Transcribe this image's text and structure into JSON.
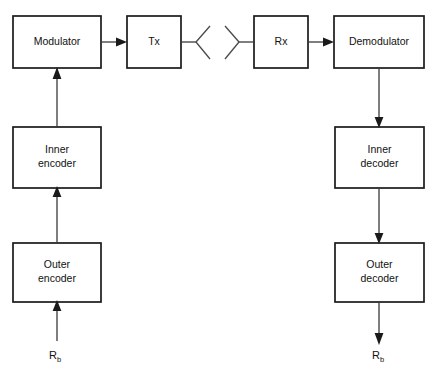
{
  "diagram": {
    "colors": {
      "box_stroke": "#1a1a1a",
      "connector": "#3a3a3a",
      "antenna": "#4a4a4a",
      "background": "#ffffff",
      "text": "#111111"
    },
    "blocks": [
      {
        "id": "modulator",
        "label": "Modulator",
        "x": 13,
        "y": 16,
        "w": 88,
        "h": 52
      },
      {
        "id": "tx",
        "label": "Tx",
        "x": 127,
        "y": 16,
        "w": 54,
        "h": 52
      },
      {
        "id": "rx",
        "label": "Rx",
        "x": 254,
        "y": 16,
        "w": 54,
        "h": 52
      },
      {
        "id": "demodulator",
        "label": "Demodulator",
        "x": 334,
        "y": 16,
        "w": 90,
        "h": 52
      },
      {
        "id": "inner-encoder",
        "label": "Inner\nencoder",
        "x": 13,
        "y": 127,
        "w": 88,
        "h": 61
      },
      {
        "id": "inner-decoder",
        "label": "Inner\ndecoder",
        "x": 335,
        "y": 127,
        "w": 89,
        "h": 61
      },
      {
        "id": "outer-encoder",
        "label": "Outer\nencoder",
        "x": 13,
        "y": 243,
        "w": 88,
        "h": 59
      },
      {
        "id": "outer-decoder",
        "label": "Outer\ndecoder",
        "x": 335,
        "y": 243,
        "w": 89,
        "h": 59
      }
    ],
    "signals": [
      {
        "id": "input-bit-rate",
        "text": "R",
        "sub": "b",
        "x": 49,
        "y": 349
      },
      {
        "id": "output-bit-rate",
        "text": "R",
        "sub": "b",
        "x": 372,
        "y": 349
      }
    ],
    "antennas": [
      {
        "id": "tx-antenna",
        "orientation": "opens-right"
      },
      {
        "id": "rx-antenna",
        "orientation": "opens-left"
      }
    ],
    "connections": [
      {
        "id": "outer-encoder-to-inner-encoder",
        "from": "outer-encoder",
        "to": "inner-encoder",
        "direction": "up"
      },
      {
        "id": "inner-encoder-to-modulator",
        "from": "inner-encoder",
        "to": "modulator",
        "direction": "up"
      },
      {
        "id": "modulator-to-tx",
        "from": "modulator",
        "to": "tx",
        "direction": "right"
      },
      {
        "id": "tx-to-antenna",
        "from": "tx",
        "to": "tx-antenna",
        "direction": "right"
      },
      {
        "id": "antenna-to-rx",
        "from": "rx-antenna",
        "to": "rx",
        "direction": "right"
      },
      {
        "id": "rx-to-demodulator",
        "from": "rx",
        "to": "demodulator",
        "direction": "right"
      },
      {
        "id": "demodulator-to-inner-decoder",
        "from": "demodulator",
        "to": "inner-decoder",
        "direction": "down"
      },
      {
        "id": "inner-decoder-to-outer-decoder",
        "from": "inner-decoder",
        "to": "outer-decoder",
        "direction": "down"
      },
      {
        "id": "source-to-outer-encoder",
        "from": "input-bit-rate",
        "to": "outer-encoder",
        "direction": "up"
      },
      {
        "id": "outer-decoder-to-sink",
        "from": "outer-decoder",
        "to": "output-bit-rate",
        "direction": "down"
      }
    ]
  }
}
